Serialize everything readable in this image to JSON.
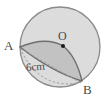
{
  "figure": {
    "kind": "geometry-diagram",
    "labels": {
      "point_a": "A",
      "point_b": "B",
      "center_o": "O",
      "measure": "6cm"
    },
    "colors": {
      "background": "#ffffff",
      "circle_fill": "#dcdcdc",
      "circle_stroke": "#8a8a8a",
      "segment_fill": "#c2c2c2",
      "segment_stroke": "#6e6e6e",
      "dash_stroke": "#9a9a9a",
      "label_color": "#4a4a4a",
      "center_dot": "#1a1a1a"
    },
    "geometry": {
      "circle_center_x": 60,
      "circle_center_y": 47,
      "circle_radius": 40,
      "point_a_x": 20,
      "point_a_y": 47,
      "point_b_x": 82,
      "point_b_y": 81,
      "center_dot_x": 63,
      "center_dot_y": 46,
      "center_dot_radius": 2,
      "chord_length_label": "6cm"
    },
    "stroke_widths": {
      "circle": 1.3,
      "segment": 1.4,
      "dashed": 1.0
    },
    "dash_pattern": "2.2 2.2"
  }
}
